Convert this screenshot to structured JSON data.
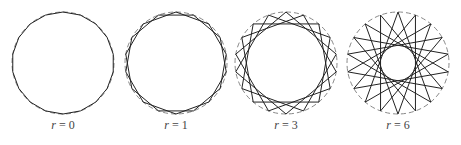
{
  "figure": {
    "vertices": 18,
    "radius": 51,
    "center_y": 63,
    "colors": {
      "line": "#222222",
      "circle": "#888888"
    },
    "panels": [
      {
        "r_value": "0",
        "var": "r",
        "eq": " = ",
        "center_x": 63,
        "step": 1
      },
      {
        "r_value": "1",
        "var": "r",
        "eq": " = ",
        "center_x": 176,
        "step": 2
      },
      {
        "r_value": "3",
        "var": "r",
        "eq": " = ",
        "center_x": 286,
        "step": 4
      },
      {
        "r_value": "6",
        "var": "r",
        "eq": " = ",
        "center_x": 398,
        "step": 7
      }
    ]
  }
}
